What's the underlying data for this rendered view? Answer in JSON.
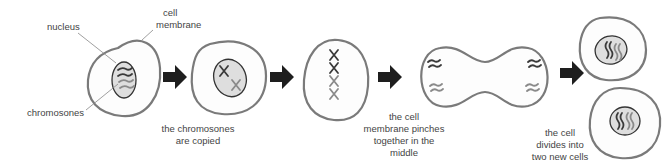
{
  "diagram": {
    "labels": {
      "nucleus": "nucleus",
      "cell_membrane_line1": "cell",
      "cell_membrane_line2": "membrane",
      "chromosomes": "chromosones"
    },
    "stages": [
      {
        "id": "stage-1",
        "caption": []
      },
      {
        "id": "stage-2",
        "caption": [
          "the chromosones",
          "are copied"
        ]
      },
      {
        "id": "stage-3",
        "caption": []
      },
      {
        "id": "stage-4",
        "caption": [
          "the cell",
          "membrane pinches",
          "together in the",
          "middle"
        ]
      },
      {
        "id": "stage-5",
        "caption": [
          "the cell",
          "divides into",
          "two new cells"
        ]
      }
    ],
    "colors": {
      "membrane": "#7a7a7a",
      "nucleus_fill": "#dedede",
      "chromosome_dark": "#3a3a3a",
      "chromosome_light": "#8a8a8a",
      "arrow": "#1e1e1e"
    }
  }
}
